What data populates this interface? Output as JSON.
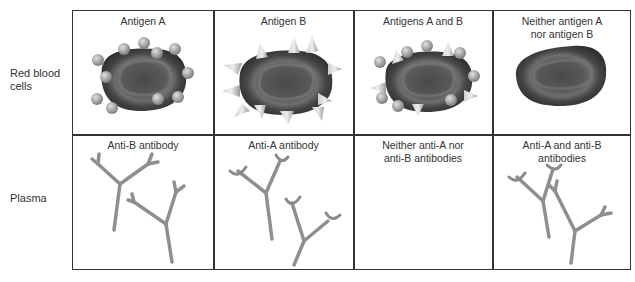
{
  "rows": [
    {
      "label_line1": "Red blood",
      "label_line2": "cells"
    },
    {
      "label_line1": "Plasma",
      "label_line2": ""
    }
  ],
  "columns": [
    {
      "rbc_title_line1": "Antigen A",
      "rbc_title_line2": "",
      "rbc_antigens": "spheres",
      "plasma_title_line1": "Anti-B antibody",
      "plasma_title_line2": "",
      "antibody_tips": "forked"
    },
    {
      "rbc_title_line1": "Antigen B",
      "rbc_title_line2": "",
      "rbc_antigens": "cones",
      "plasma_title_line1": "Anti-A antibody",
      "plasma_title_line2": "",
      "antibody_tips": "crescent"
    },
    {
      "rbc_title_line1": "Antigens A and B",
      "rbc_title_line2": "",
      "rbc_antigens": "spheres-and-cones",
      "plasma_title_line1": "Neither anti-A nor",
      "plasma_title_line2": "anti-B antibodies",
      "antibody_tips": "none"
    },
    {
      "rbc_title_line1": "Neither antigen A",
      "rbc_title_line2": "nor antigen B",
      "rbc_antigens": "none",
      "plasma_title_line1": "Anti-A and anti-B",
      "plasma_title_line2": "antibodies",
      "antibody_tips": "crescent-and-forked"
    }
  ],
  "colors": {
    "cell_dark": "#3a3a3a",
    "cell_mid": "#5a5a5a",
    "antigen": "#a8a8a8",
    "antibody": "#8f8f8f",
    "grid_line": "#333333"
  }
}
